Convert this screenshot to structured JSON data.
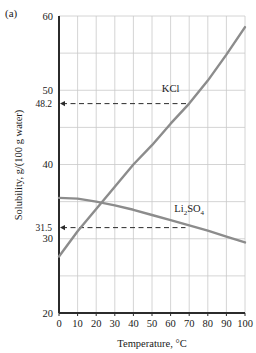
{
  "figure": {
    "panel_label": "(a)"
  },
  "chart_data": {
    "type": "line",
    "title": "",
    "xlabel": "Temperature, °C",
    "ylabel": "Solubility, g/(100 g water)",
    "xlim": [
      0,
      100
    ],
    "ylim": [
      20,
      60
    ],
    "grid": true,
    "legend_position": "inline-labels",
    "x_ticks": [
      0,
      10,
      20,
      30,
      40,
      50,
      60,
      70,
      80,
      90,
      100
    ],
    "x_tick_labels": [
      "0",
      "10",
      "20",
      "30",
      "40",
      "50",
      "60",
      "70",
      "80",
      "90",
      "100"
    ],
    "y_ticks": [
      20,
      30,
      40,
      50,
      60
    ],
    "y_tick_labels": [
      "20",
      "30",
      "40",
      "50",
      "60"
    ],
    "y_gridlines": [
      20,
      25,
      30,
      35,
      40,
      45,
      50,
      55,
      60
    ],
    "y_special_ticks": [
      {
        "value": 48.2,
        "label": "48.2"
      },
      {
        "value": 31.5,
        "label": "31.5"
      }
    ],
    "x": [
      0,
      10,
      20,
      30,
      40,
      50,
      60,
      70,
      80,
      90,
      100
    ],
    "series": [
      {
        "name": "KCl",
        "label": "KCl",
        "color": "#8c8c8c",
        "values": [
          27.6,
          31.0,
          34.0,
          37.0,
          40.0,
          42.6,
          45.5,
          48.2,
          51.3,
          54.8,
          58.5
        ]
      },
      {
        "name": "Li2SO4",
        "label": "Li2SO4",
        "label_parts": [
          {
            "text": "Li",
            "sub": false
          },
          {
            "text": "2",
            "sub": true
          },
          {
            "text": "SO",
            "sub": false
          },
          {
            "text": "4",
            "sub": true
          }
        ],
        "color": "#8c8c8c",
        "values": [
          35.5,
          35.4,
          35.0,
          34.5,
          33.9,
          33.2,
          32.5,
          31.8,
          31.1,
          30.3,
          29.5
        ]
      }
    ],
    "reference_lines": [
      {
        "axis": "y",
        "value": 48.2,
        "label": "48.2",
        "style": "dashed",
        "arrow": "left",
        "x_end": 70
      },
      {
        "axis": "y",
        "value": 31.5,
        "label": "31.5",
        "style": "dashed",
        "arrow": "left",
        "x_end": 68
      }
    ],
    "annotations": [
      {
        "text": "KCl",
        "x": 60,
        "y": 49.8
      },
      {
        "text": "Li2SO4",
        "x": 70,
        "y": 33.6
      }
    ]
  }
}
